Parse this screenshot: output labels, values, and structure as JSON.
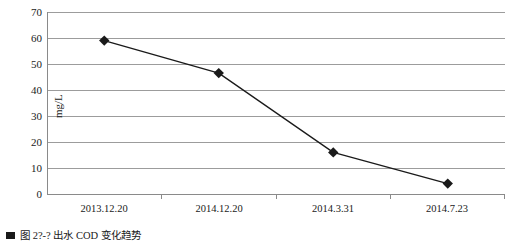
{
  "chart_data": {
    "type": "line",
    "title": "",
    "xlabel": "",
    "ylabel": "mg/L",
    "categories": [
      "2013.12.20",
      "2014.12.20",
      "2014.3.31",
      "2014.7.23"
    ],
    "values": [
      59,
      46.5,
      16,
      4
    ],
    "series": [
      {
        "name": "COD",
        "values": [
          59,
          46.5,
          16,
          4
        ]
      }
    ],
    "ylim": [
      0,
      70
    ],
    "yticks": [
      0,
      10,
      20,
      30,
      40,
      50,
      60,
      70
    ],
    "ytick_labels": [
      "0",
      "10",
      "20",
      "30",
      "40",
      "50",
      "60",
      "70"
    ],
    "grid": "horizontal",
    "legend": "none",
    "marker": "diamond",
    "line_color": "#1a1a1a",
    "marker_color": "#1a1a1a",
    "grid_color": "#9c9c9c",
    "axis_color": "#8a8a8a",
    "background": "#ffffff"
  },
  "caption": {
    "bullet": "",
    "text": "图 2?-?  出水 COD 变化趋势"
  }
}
